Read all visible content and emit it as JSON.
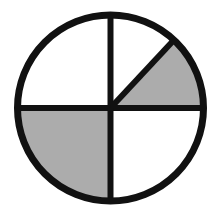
{
  "diagram": {
    "type": "fraction-circle",
    "center": {
      "x": 110.5,
      "y": 108
    },
    "radius": 93,
    "stroke_width": 7,
    "colors": {
      "background": "#ffffff",
      "outline": "#111111",
      "shaded": "#acacac",
      "unshaded": "#ffffff"
    },
    "sectors": [
      {
        "name": "top-left-quarter",
        "start_deg": 90,
        "end_deg": 180,
        "shaded": false,
        "fraction": "1/4"
      },
      {
        "name": "top-right-upper-eighth",
        "start_deg": 47,
        "end_deg": 90,
        "shaded": false,
        "fraction": "1/8"
      },
      {
        "name": "top-right-lower-eighth",
        "start_deg": 0,
        "end_deg": 47,
        "shaded": true,
        "fraction": "1/8"
      },
      {
        "name": "bottom-right-quarter",
        "start_deg": 270,
        "end_deg": 360,
        "shaded": false,
        "fraction": "1/4"
      },
      {
        "name": "bottom-left-quarter",
        "start_deg": 180,
        "end_deg": 270,
        "shaded": true,
        "fraction": "1/4"
      }
    ],
    "shaded_fraction": "3/8"
  }
}
